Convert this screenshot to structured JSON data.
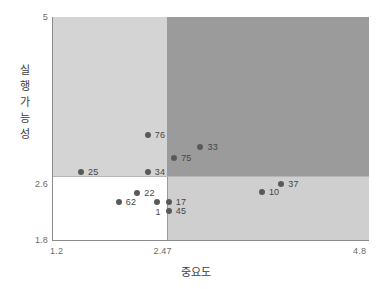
{
  "chart_data": {
    "type": "scatter",
    "title": "",
    "xlabel": "중요도",
    "ylabel": "실행 가능성",
    "ylabel_chars": [
      "실",
      "행",
      "가",
      "능",
      "성"
    ],
    "xlim": [
      1.2,
      4.8
    ],
    "ylim": [
      1.8,
      5.0
    ],
    "xticks": [
      "1.2",
      "2.47",
      "4.8"
    ],
    "yticks": [
      "5",
      "2.6",
      "1.8"
    ],
    "xtick_values": [
      1.2,
      2.47,
      4.8
    ],
    "ytick_values": [
      5,
      2.6,
      1.8
    ],
    "grid": false,
    "legend": null,
    "quadrant_divider_x": 2.47,
    "quadrant_divider_y": 2.6,
    "quadrant_colors": {
      "top_left": "#d4d4d4",
      "top_right": "#9b9b9b",
      "bottom_left": "#ffffff",
      "bottom_right": "#cfcfcf"
    },
    "point_color": "#595959",
    "points": [
      {
        "label": "25",
        "x": 1.52,
        "y": 2.77,
        "label_pos": "right"
      },
      {
        "label": "76",
        "x": 2.28,
        "y": 3.3,
        "label_pos": "right"
      },
      {
        "label": "34",
        "x": 2.28,
        "y": 2.77,
        "label_pos": "right"
      },
      {
        "label": "75",
        "x": 2.58,
        "y": 2.97,
        "label_pos": "right"
      },
      {
        "label": "33",
        "x": 2.88,
        "y": 3.14,
        "label_pos": "right"
      },
      {
        "label": "37",
        "x": 3.8,
        "y": 2.6,
        "label_pos": "right"
      },
      {
        "label": "10",
        "x": 3.58,
        "y": 2.49,
        "label_pos": "right"
      },
      {
        "label": "22",
        "x": 2.16,
        "y": 2.48,
        "label_pos": "right"
      },
      {
        "label": "62",
        "x": 1.95,
        "y": 2.35,
        "label_pos": "right"
      },
      {
        "label": "1",
        "x": 2.39,
        "y": 2.35,
        "label_pos": "below"
      },
      {
        "label": "17",
        "x": 2.52,
        "y": 2.35,
        "label_pos": "right"
      },
      {
        "label": "45",
        "x": 2.52,
        "y": 2.22,
        "label_pos": "right"
      }
    ]
  }
}
